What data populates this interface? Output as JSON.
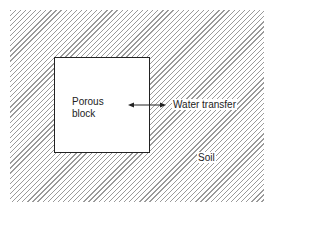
{
  "diagram": {
    "block_label_line1": "Porous",
    "block_label_line2": "block",
    "arrow_label": "Water transfer",
    "region_label": "Soil",
    "colors": {
      "hatch": "#9a9a9a",
      "line": "#222222",
      "background": "#ffffff"
    }
  }
}
